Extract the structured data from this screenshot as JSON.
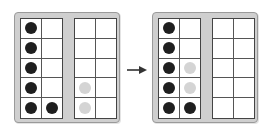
{
  "diagram": {
    "colors": {
      "filled": "#1f1f1f",
      "moved": "#d4d4d4",
      "frame": "#cfcfcf"
    },
    "before": {
      "frames": [
        {
          "cells": [
            "black",
            "empty",
            "black",
            "empty",
            "black",
            "empty",
            "black",
            "empty",
            "black",
            "black"
          ]
        },
        {
          "cells": [
            "empty",
            "empty",
            "empty",
            "empty",
            "empty",
            "empty",
            "gray",
            "empty",
            "gray",
            "empty"
          ]
        }
      ]
    },
    "arrow": "right-arrow",
    "after": {
      "frames": [
        {
          "cells": [
            "black",
            "empty",
            "black",
            "empty",
            "black",
            "gray",
            "black",
            "gray",
            "black",
            "black"
          ]
        },
        {
          "cells": [
            "empty",
            "empty",
            "empty",
            "empty",
            "empty",
            "empty",
            "empty",
            "empty",
            "empty",
            "empty"
          ]
        }
      ]
    }
  }
}
